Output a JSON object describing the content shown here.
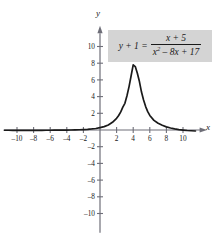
{
  "figure": {
    "equation": {
      "lhs": "y + 1 =",
      "numerator": "x + 5",
      "denominator_base": "x",
      "denominator_exp": "2",
      "denominator_rest": "– 8x + 17",
      "box_color": "#d4d4d4"
    },
    "axis_labels": {
      "x": "x",
      "y": "y"
    },
    "curve_color": "#1a1a1a",
    "axis_color": "#6e6e78"
  },
  "chart_data": {
    "type": "line",
    "title": "",
    "subtitle": "",
    "xlabel": "x",
    "ylabel": "y",
    "equation_text": "y + 1 = (x + 5) / (x^2 - 8x + 17)",
    "plotted_expression": "(x + 5) / (x^2 - 8x + 17)",
    "xlim": [
      -11.5,
      11.5
    ],
    "ylim": [
      -11.5,
      11.5
    ],
    "grid": false,
    "legend": "none",
    "x_ticks": [
      -10,
      -8,
      -6,
      -4,
      -2,
      2,
      4,
      6,
      8,
      10
    ],
    "y_ticks": [
      -10,
      -8,
      -6,
      -4,
      -2,
      2,
      4,
      6,
      8,
      10
    ],
    "x_tick_labels": [
      "–10",
      "–8",
      "–6",
      "–4",
      "–2",
      "2",
      "4",
      "6",
      "8",
      "10"
    ],
    "y_tick_labels": [
      "–10",
      "–8",
      "–6",
      "–4",
      "–2",
      "2",
      "4",
      "6",
      "8",
      "10"
    ],
    "annotations": [
      {
        "text": "peak near x = 4, y ≈ 7.9"
      }
    ],
    "series": [
      {
        "name": "(x+5)/(x^2-8x+17)",
        "x": [
          -11.5,
          -11,
          -10.5,
          -10,
          -9.5,
          -9,
          -8.5,
          -8,
          -7.5,
          -7,
          -6.5,
          -6,
          -5.5,
          -5,
          -4.5,
          -4,
          -3.5,
          -3,
          -2.5,
          -2,
          -1.5,
          -1,
          -0.5,
          0,
          0.5,
          1,
          1.5,
          2,
          2.25,
          2.5,
          2.75,
          3,
          3.25,
          3.5,
          3.75,
          4,
          4.25,
          4.5,
          4.75,
          5,
          5.25,
          5.5,
          5.75,
          6,
          6.5,
          7,
          7.5,
          8,
          8.5,
          9,
          9.5,
          10,
          10.5,
          11,
          11.5
        ],
        "y": [
          -0.031,
          -0.032,
          -0.033,
          -0.034,
          -0.034,
          -0.035,
          -0.035,
          -0.035,
          -0.034,
          -0.033,
          -0.031,
          -0.029,
          -0.026,
          -0.021,
          -0.015,
          -0.008,
          0.002,
          0.015,
          0.032,
          0.054,
          0.083,
          0.123,
          0.177,
          0.294,
          0.4,
          0.6,
          0.92,
          1.4,
          1.74,
          2.17,
          2.73,
          3.2,
          4.1,
          5.2,
          6.5,
          7.8,
          7.6,
          6.8,
          5.8,
          4.54,
          3.6,
          2.8,
          2.2,
          1.74,
          1.15,
          0.8,
          0.56,
          0.38,
          0.24,
          0.13,
          0.05,
          -0.01,
          -0.06,
          -0.09,
          -0.12
        ]
      }
    ]
  }
}
